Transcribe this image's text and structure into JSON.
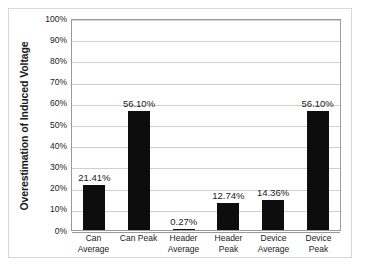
{
  "chart_data": {
    "type": "bar",
    "title": "",
    "xlabel": "",
    "ylabel": "Overestimation of Induced Voltage",
    "ylim": [
      0,
      100
    ],
    "grid": true,
    "legend": "none",
    "unit": "%",
    "categories": [
      "Can Average",
      "Can Peak",
      "Header Average",
      "Header Peak",
      "Device Average",
      "Device Peak"
    ],
    "values": [
      21.41,
      56.1,
      0.27,
      12.74,
      14.36,
      56.1
    ],
    "data_labels": [
      "21.41%",
      "56.10%",
      "0.27%",
      "12.74%",
      "14.36%",
      "56.10%"
    ],
    "y_ticks": [
      "100%",
      "90%",
      "80%",
      "70%",
      "60%",
      "50%",
      "40%",
      "30%",
      "20%",
      "10%",
      "0%"
    ],
    "y_tick_values": [
      100,
      90,
      80,
      70,
      60,
      50,
      40,
      30,
      20,
      10,
      0
    ],
    "colors": {
      "bar": "#0d0d0d",
      "gridline": "#cfcfcf",
      "axis": "#9a9a9a",
      "frame": "#d8d8d8",
      "text": "#1a1a1a",
      "background": "#ffffff"
    }
  }
}
